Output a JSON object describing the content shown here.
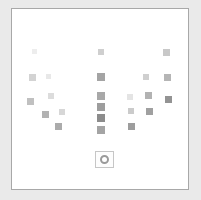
{
  "panel": {
    "background": "#ffffff",
    "border_color": "#a8a8a8",
    "outer_background": "#eaeaea"
  },
  "marker": {
    "name": "point-marker",
    "icon": "circle-outline-icon",
    "label": ""
  },
  "chart_data": {
    "type": "scatter",
    "title": "",
    "subtitle": "",
    "xlabel": "",
    "ylabel": "",
    "xlim": [
      0,
      178
    ],
    "ylim": [
      0,
      182
    ],
    "grid": false,
    "legend": null,
    "tick_labels_x": [],
    "tick_labels_y": [],
    "marker_shape": "square",
    "colormap": "grays",
    "note": "Sparse matrix of gray squares; darkness encodes value (light = low, dark = high).",
    "clusters": [
      {
        "name": "left-cluster",
        "count": 7
      },
      {
        "name": "center-column",
        "count": 6
      },
      {
        "name": "right-cluster",
        "count": 9
      }
    ],
    "points": [
      {
        "cluster": "left-cluster",
        "x": 20,
        "y": 40,
        "size": 5,
        "value": 0.1,
        "color": "#ededed"
      },
      {
        "cluster": "left-cluster",
        "x": 17,
        "y": 65,
        "size": 7,
        "value": 0.28,
        "color": "#d3d3d3"
      },
      {
        "cluster": "left-cluster",
        "x": 34,
        "y": 65,
        "size": 5,
        "value": 0.14,
        "color": "#e8e8e8"
      },
      {
        "cluster": "left-cluster",
        "x": 36,
        "y": 84,
        "size": 6,
        "value": 0.22,
        "color": "#dcdcdc"
      },
      {
        "cluster": "left-cluster",
        "x": 15,
        "y": 89,
        "size": 7,
        "value": 0.38,
        "color": "#c0c0c0"
      },
      {
        "cluster": "left-cluster",
        "x": 30,
        "y": 102,
        "size": 7,
        "value": 0.46,
        "color": "#b2b2b2"
      },
      {
        "cluster": "left-cluster",
        "x": 47,
        "y": 100,
        "size": 6,
        "value": 0.26,
        "color": "#d7d7d7"
      },
      {
        "cluster": "left-cluster",
        "x": 43,
        "y": 114,
        "size": 7,
        "value": 0.48,
        "color": "#ababab"
      },
      {
        "cluster": "center-column",
        "x": 86,
        "y": 40,
        "size": 6,
        "value": 0.3,
        "color": "#cfcfcf"
      },
      {
        "cluster": "center-column",
        "x": 85,
        "y": 64,
        "size": 8,
        "value": 0.52,
        "color": "#a4a4a4"
      },
      {
        "cluster": "center-column",
        "x": 85,
        "y": 83,
        "size": 8,
        "value": 0.5,
        "color": "#a8a8a8"
      },
      {
        "cluster": "center-column",
        "x": 85,
        "y": 94,
        "size": 8,
        "value": 0.56,
        "color": "#9d9d9d"
      },
      {
        "cluster": "center-column",
        "x": 85,
        "y": 105,
        "size": 8,
        "value": 0.66,
        "color": "#8c8c8c"
      },
      {
        "cluster": "center-column",
        "x": 85,
        "y": 117,
        "size": 8,
        "value": 0.52,
        "color": "#a4a4a4"
      },
      {
        "cluster": "right-cluster",
        "x": 151,
        "y": 40,
        "size": 7,
        "value": 0.34,
        "color": "#c8c8c8"
      },
      {
        "cluster": "right-cluster",
        "x": 131,
        "y": 65,
        "size": 6,
        "value": 0.3,
        "color": "#cfcfcf"
      },
      {
        "cluster": "right-cluster",
        "x": 152,
        "y": 65,
        "size": 7,
        "value": 0.44,
        "color": "#b5b5b5"
      },
      {
        "cluster": "right-cluster",
        "x": 115,
        "y": 85,
        "size": 6,
        "value": 0.16,
        "color": "#e4e4e4"
      },
      {
        "cluster": "right-cluster",
        "x": 133,
        "y": 83,
        "size": 7,
        "value": 0.46,
        "color": "#b2b2b2"
      },
      {
        "cluster": "right-cluster",
        "x": 153,
        "y": 87,
        "size": 7,
        "value": 0.62,
        "color": "#939393"
      },
      {
        "cluster": "right-cluster",
        "x": 116,
        "y": 99,
        "size": 6,
        "value": 0.32,
        "color": "#cbcbcb"
      },
      {
        "cluster": "right-cluster",
        "x": 134,
        "y": 99,
        "size": 7,
        "value": 0.54,
        "color": "#a0a0a0"
      },
      {
        "cluster": "right-cluster",
        "x": 116,
        "y": 114,
        "size": 7,
        "value": 0.56,
        "color": "#9d9d9d"
      }
    ]
  }
}
